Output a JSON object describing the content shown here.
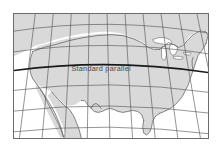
{
  "figure": {
    "name": "conic-projection-map",
    "title": "",
    "background_color": "#ffffff",
    "frame": {
      "border_color": "#6b6b6b",
      "border_width_px": 1,
      "x": 13,
      "y": 13,
      "width": 196,
      "height": 126
    }
  },
  "map": {
    "region": "Contiguous United States",
    "projection": "conic",
    "land_fill_color": "#d9d9d9",
    "land_outline_color": "#555555",
    "water_fill_color": "#ffffff",
    "graticule": {
      "color": "#4d4d4d",
      "stroke_width": 0.6,
      "meridian_count": 12,
      "parallel_count": 6,
      "visible": true
    },
    "standard_parallel": {
      "label": "Standard  parallel",
      "label_color": "#4a4a4a",
      "line_color": "#1a1a1a",
      "stroke_width": 1.6,
      "visible": true
    },
    "features": [
      "Great Lakes",
      "Florida peninsula",
      "Baja California",
      "Chesapeake Bay",
      "Gulf of Mexico",
      "Pacific Coast",
      "Atlantic Coast",
      "US-Canada border"
    ]
  },
  "annotations": {
    "standard_parallel_label": "Standard  parallel"
  }
}
